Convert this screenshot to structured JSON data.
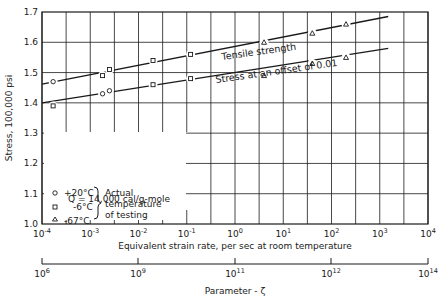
{
  "chart_data": {
    "type": "line",
    "title": "",
    "xlabel": "Equivalent strain rate, per sec at room temperature",
    "ylabel": "Stress, 100,000 psi",
    "x_scale": "log",
    "xlim": [
      0.0001,
      10000
    ],
    "ylim": [
      1.0,
      1.7
    ],
    "grid": true,
    "x_ticks": [
      "10^-4",
      "10^-3",
      "10^-2",
      "10^-1",
      "10^0",
      "10^1",
      "10^2",
      "10^3",
      "10^4"
    ],
    "y_ticks": [
      "1.0",
      "1.1",
      "1.2",
      "1.3",
      "1.4",
      "1.5",
      "1.6",
      "1.7"
    ],
    "secondary_x_axis": {
      "label": "Parameter - ζ",
      "ticks": [
        "10^6",
        "10^9",
        "10^11",
        "10^12",
        "10^14"
      ]
    },
    "series": [
      {
        "name": "Tensile strength",
        "line": {
          "x": [
            0.0001,
            1500
          ],
          "y": [
            1.462,
            1.685
          ]
        },
        "points": [
          {
            "marker": "circle",
            "temp": "+20°C",
            "x": 0.00017,
            "y": 1.47
          },
          {
            "marker": "square",
            "temp": "-6°C",
            "x": 0.0018,
            "y": 1.49
          },
          {
            "marker": "square",
            "temp": "-6°C",
            "x": 0.0025,
            "y": 1.51
          },
          {
            "marker": "square",
            "temp": "-6°C",
            "x": 0.02,
            "y": 1.54
          },
          {
            "marker": "square",
            "temp": "-6°C",
            "x": 0.12,
            "y": 1.56
          },
          {
            "marker": "triangle",
            "temp": "-67°C",
            "x": 4.0,
            "y": 1.6
          },
          {
            "marker": "triangle",
            "temp": "-67°C",
            "x": 40,
            "y": 1.63
          },
          {
            "marker": "triangle",
            "temp": "-67°C",
            "x": 200,
            "y": 1.66
          }
        ]
      },
      {
        "name": "Stress at an offset of 0.01",
        "line": {
          "x": [
            0.0001,
            1500
          ],
          "y": [
            1.4,
            1.58
          ]
        },
        "points": [
          {
            "marker": "square",
            "temp": "-6°C",
            "x": 0.00017,
            "y": 1.39
          },
          {
            "marker": "circle",
            "temp": "+20°C",
            "x": 0.0018,
            "y": 1.43
          },
          {
            "marker": "circle",
            "temp": "+20°C",
            "x": 0.0025,
            "y": 1.44
          },
          {
            "marker": "square",
            "temp": "-6°C",
            "x": 0.02,
            "y": 1.46
          },
          {
            "marker": "square",
            "temp": "-6°C",
            "x": 0.12,
            "y": 1.48
          },
          {
            "marker": "triangle",
            "temp": "-67°C",
            "x": 4.0,
            "y": 1.49
          },
          {
            "marker": "triangle",
            "temp": "-67°C",
            "x": 40,
            "y": 1.53
          },
          {
            "marker": "triangle",
            "temp": "-67°C",
            "x": 200,
            "y": 1.55
          }
        ]
      }
    ],
    "legend": {
      "entries": [
        {
          "marker": "circle",
          "label": "+20°C"
        },
        {
          "marker": "square",
          "label": "-6°C"
        },
        {
          "marker": "triangle",
          "label": "-67°C"
        }
      ],
      "brace_label": [
        "Actual",
        "temperature",
        "of testing"
      ],
      "note": "Q = 14,000 cal/g-mole",
      "position": "lower-left"
    }
  },
  "labels": {
    "tensile": "Tensile strength",
    "offset": "Stress at an offset of 0.01",
    "ylabel": "Stress, 100,000 psi",
    "xlabel": "Equivalent strain rate, per sec at room temperature",
    "param_label": "Parameter - ζ",
    "note": "Q = 14,000 cal/g-mole",
    "legend_t1": "+20°C",
    "legend_t2": "-6°C",
    "legend_t3": "-67°C",
    "brace1": "Actual",
    "brace2": "temperature",
    "brace3": "of testing"
  }
}
